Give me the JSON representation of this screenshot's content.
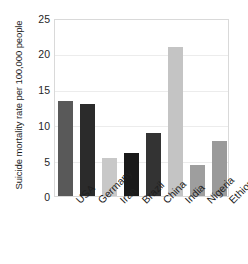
{
  "chart_data": {
    "type": "bar",
    "title": "",
    "subtitle": "",
    "xlabel": "",
    "ylabel": "Suicide mortality rate per 100,000 people",
    "categories": [
      "USA",
      "Germany",
      "Iran",
      "Brazil",
      "China",
      "India",
      "Nigeria",
      "Ethiopia"
    ],
    "values": [
      13.5,
      13.0,
      5.4,
      6.1,
      8.9,
      21.1,
      4.4,
      7.8
    ],
    "bar_colors": [
      "#595959",
      "#2b2b2b",
      "#c8c8c8",
      "#1a1a1a",
      "#333333",
      "#c4c4c4",
      "#9e9e9e",
      "#9a9a9a"
    ],
    "ylim": [
      0,
      25
    ],
    "yticks": [
      0,
      5,
      10,
      15,
      20,
      25
    ],
    "ytick_labels": [
      "0",
      "5",
      "10",
      "15",
      "20",
      "25"
    ],
    "grid": true,
    "grid_axis": "y",
    "legend": false,
    "legend_position": "none",
    "xtick_rotation": 45,
    "series": [
      {
        "name": "Suicide mortality rate",
        "values": [
          13.5,
          13.0,
          5.4,
          6.1,
          8.9,
          21.1,
          4.4,
          7.8
        ]
      }
    ]
  },
  "colors": {
    "background": "#ffffff",
    "frame": "#d9d9d9",
    "gridline": "#ececec",
    "text": "#1f1f1f"
  }
}
